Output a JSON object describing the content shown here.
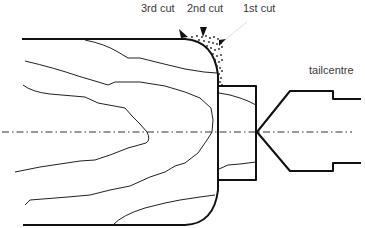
{
  "diagram": {
    "labels": {
      "cut3": "3rd cut",
      "cut2": "2nd cut",
      "cut1": "1st cut",
      "tailcentre": "tailcentre"
    },
    "colors": {
      "line": "#111111",
      "text": "#3a3a3a",
      "background": "#ffffff"
    },
    "elements": [
      "workpiece outline with rounded end",
      "wood grain lines",
      "waste chips (dotted region)",
      "three cut arrows",
      "collar / spigot block",
      "tailcentre cone",
      "dash-dot centre line"
    ]
  }
}
